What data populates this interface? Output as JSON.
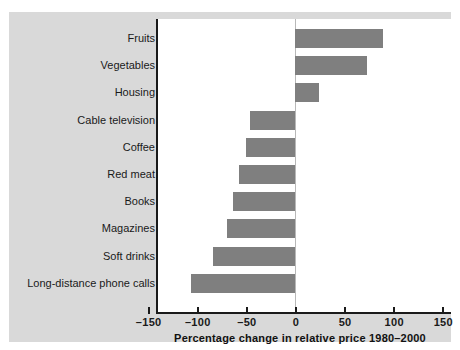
{
  "chart_data": {
    "type": "bar",
    "orientation": "horizontal",
    "title": "",
    "xlabel": "Percentage change in relative price 1980–2000",
    "ylabel": "",
    "xlim": [
      -150,
      150
    ],
    "xticks": [
      -150,
      -100,
      -50,
      0,
      50,
      100,
      150
    ],
    "xticklabels": [
      "–150",
      "–100",
      "–50",
      "0",
      "50",
      "100",
      "150"
    ],
    "grid": false,
    "legend": null,
    "bar_color": "#7f7f7f",
    "categories": [
      "Fruits",
      "Vegetables",
      "Housing",
      "Cable television",
      "Coffee",
      "Red meat",
      "Books",
      "Magazines",
      "Soft drinks",
      "Long-distance phone calls"
    ],
    "values": [
      90,
      73,
      24,
      -46,
      -50,
      -57,
      -63,
      -69,
      -84,
      -106
    ]
  },
  "figure": {
    "background": "#d9d9d9",
    "plot_background": "#ffffff",
    "axis_color": "#1a1a1a"
  }
}
